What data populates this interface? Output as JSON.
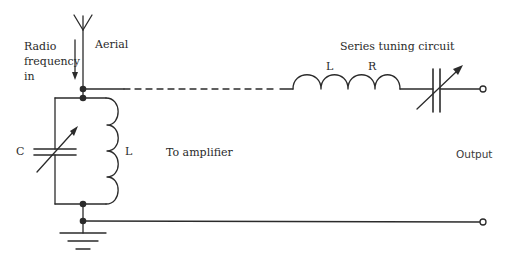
{
  "diagram": {
    "type": "circuit-schematic",
    "labels": {
      "rf_in_line1": "Radio",
      "rf_in_line2": "frequency",
      "rf_in_line3": "in",
      "aerial": "Aerial",
      "tank_capacitor": "C",
      "tank_inductor": "L",
      "to_amplifier": "To amplifier",
      "series_title": "Series tuning circuit",
      "series_inductor": "L",
      "series_resistor": "R",
      "output": "Output"
    },
    "components": [
      {
        "id": "aerial",
        "kind": "antenna"
      },
      {
        "id": "tank_capacitor",
        "kind": "variable-capacitor",
        "label": "C"
      },
      {
        "id": "tank_inductor",
        "kind": "inductor",
        "label": "L"
      },
      {
        "id": "series_inductor",
        "kind": "inductor",
        "label": "L"
      },
      {
        "id": "series_resistance",
        "kind": "resistance",
        "label": "R"
      },
      {
        "id": "series_capacitor",
        "kind": "variable-capacitor"
      },
      {
        "id": "ground",
        "kind": "ground"
      },
      {
        "id": "output_terminal_top",
        "kind": "terminal"
      },
      {
        "id": "output_terminal_bottom",
        "kind": "terminal"
      }
    ],
    "colors": {
      "line": "#2b2b2b",
      "background": "#ffffff"
    }
  }
}
